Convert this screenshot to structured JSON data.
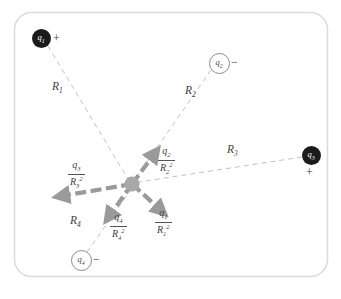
{
  "figure": {
    "frame_color": "#d9d9d9",
    "background": "#ffffff"
  },
  "center_point": {
    "name": "field-point",
    "x": 132,
    "y": 184,
    "r": 7.5,
    "color": "#a8a8a8"
  },
  "charges": [
    {
      "id": "q1",
      "label": "q",
      "sub": "1",
      "sign": "+",
      "type": "positive",
      "fill": "filled",
      "x": 41,
      "y": 38,
      "r": 9.5,
      "sign_dx": 12,
      "sign_dy": -7
    },
    {
      "id": "q2",
      "label": "q",
      "sub": "2",
      "sign": "−",
      "type": "negative",
      "fill": "open",
      "x": 218,
      "y": 62,
      "r": 9.5,
      "sign_dx": 13,
      "sign_dy": -7
    },
    {
      "id": "q3",
      "label": "q",
      "sub": "3",
      "sign": "+",
      "type": "positive",
      "fill": "filled",
      "x": 311,
      "y": 155,
      "r": 9.5,
      "sign_dx": -4,
      "sign_dy": 10
    },
    {
      "id": "q4",
      "label": "q",
      "sub": "4",
      "sign": "−",
      "type": "negative",
      "fill": "open",
      "x": 80,
      "y": 259,
      "r": 9.5,
      "sign_dx": 13,
      "sign_dy": -7
    }
  ],
  "distance_lines": [
    {
      "id": "R1",
      "label": "R",
      "sub": "1",
      "from": "q1",
      "lx": 55,
      "ly": 88
    },
    {
      "id": "R2",
      "label": "R",
      "sub": "2",
      "from": "q2",
      "lx": 188,
      "ly": 92
    },
    {
      "id": "R3",
      "label": "R",
      "sub": "3",
      "from": "q3",
      "lx": 228,
      "ly": 150
    },
    {
      "id": "R4",
      "label": "R",
      "sub": "4",
      "from": "q4",
      "lx": 74,
      "ly": 222
    }
  ],
  "force_vectors": [
    {
      "id": "F1",
      "numerator": "q",
      "num_sub": "1",
      "denominator": "R",
      "den_sub": "1",
      "den_sup": "2",
      "direction": "down-right",
      "tip_x": 167,
      "tip_y": 215,
      "lx": 152,
      "ly": 211,
      "description": "repulsion from positive q1"
    },
    {
      "id": "F2",
      "numerator": "q",
      "num_sub": "2",
      "denominator": "R",
      "den_sub": "2",
      "den_sup": "2",
      "direction": "up-right",
      "tip_x": 160,
      "tip_y": 148,
      "lx": 158,
      "ly": 140,
      "description": "attraction toward negative q2"
    },
    {
      "id": "F3",
      "numerator": "q",
      "num_sub": "3",
      "denominator": "R",
      "den_sub": "3",
      "den_sup": "2",
      "direction": "left",
      "tip_x": 55,
      "ly": 163,
      "tip_y": 193,
      "lx": 72,
      "description": "repulsion from positive q3"
    },
    {
      "id": "F4",
      "numerator": "q",
      "num_sub": "4",
      "denominator": "R",
      "den_sub": "4",
      "den_sup": "2",
      "direction": "down-left",
      "tip_x": 104,
      "tip_y": 222,
      "lx": 111,
      "ly": 211,
      "description": "attraction toward negative q4"
    }
  ],
  "colors": {
    "charge_positive_fill": "#1b1b1b",
    "charge_negative_fill": "#ffffff",
    "charge_negative_stroke": "#8a8a8a",
    "center_dot": "#a8a8a8",
    "vector_gray": "#9a9a9a",
    "distance_line": "#bdbdbd",
    "text": "#3f3f3f"
  }
}
